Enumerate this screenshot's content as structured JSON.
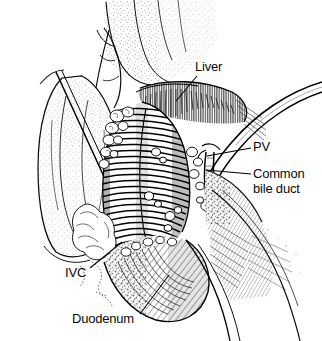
{
  "figure": {
    "style": "pen-and-ink line drawing, black on white",
    "width": 322,
    "height": 341,
    "background_color": "#ffffff",
    "ink_color": "#000000"
  },
  "labels": {
    "liver": "Liver",
    "pv": "PV",
    "common_bile_duct_line1": "Common",
    "common_bile_duct_line2": "bile duct",
    "ivc": "IVC",
    "duodenum": "Duodenum"
  },
  "caption": {
    "partial_text": ""
  },
  "structures": [
    {
      "name": "liver",
      "label": "Liver",
      "description": "Liver edge at top of field with stippled capsule and dense vertical hatching along the cut/retracted margin",
      "label_position": {
        "x": 195,
        "y": 60
      },
      "leader_from": {
        "x": 197,
        "y": 76
      },
      "leader_to": {
        "x": 176,
        "y": 100
      }
    },
    {
      "name": "portal-vein",
      "label": "PV",
      "description": "Portal vein, a smooth tubular double-outlined vessel sweeping from upper right down into the porta hepatis",
      "label_position": {
        "x": 253,
        "y": 140
      },
      "leader_from": {
        "x": 251,
        "y": 148
      },
      "leader_to": {
        "x": 207,
        "y": 156
      }
    },
    {
      "name": "common-bile-duct",
      "label": "Common bile duct",
      "description": "Common bile duct, vertical tubular structure lateral to the portal vein within the hepatoduodenal ligament",
      "label_position": {
        "x": 253,
        "y": 166
      },
      "leader_from": {
        "x": 251,
        "y": 174
      },
      "leader_to": {
        "x": 206,
        "y": 170
      }
    },
    {
      "name": "inferior-vena-cava",
      "label": "IVC",
      "description": "Inferior vena cava, large dark transversely hatched tubular structure occupying the center of the field",
      "label_position": {
        "x": 65,
        "y": 266
      },
      "leader_from": {
        "x": 90,
        "y": 268
      },
      "leader_to": {
        "x": 120,
        "y": 243
      }
    },
    {
      "name": "duodenum",
      "label": "Duodenum",
      "description": "Duodenum, rounded curved viscus at the lower field rendered with fine parallel hatching",
      "label_position": {
        "x": 72,
        "y": 312
      },
      "leader_from": {
        "x": 140,
        "y": 314
      },
      "leader_to": {
        "x": 168,
        "y": 276
      }
    },
    {
      "name": "retracted-liver-lobe",
      "label": "",
      "description": "Retracted left/caudate liver lobe at far left, outlined and lightly stippled, held by a retractor blade",
      "label_position": null
    },
    {
      "name": "nodular-tissue",
      "label": "",
      "description": "Lobulated fat and lymphatic tissue with squiggly outlines flanking the vena cava",
      "label_position": null
    }
  ]
}
